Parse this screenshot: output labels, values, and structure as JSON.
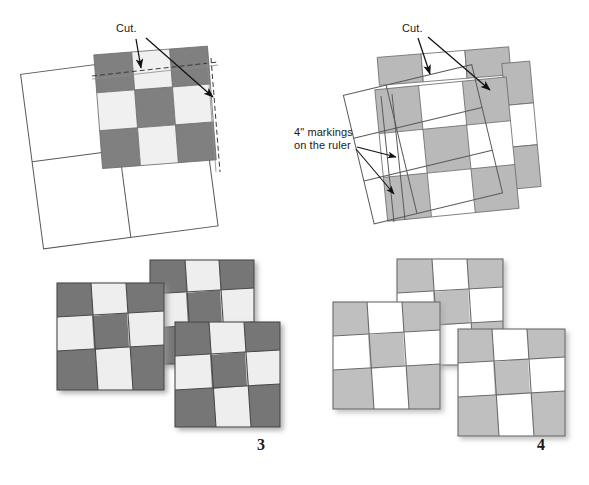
{
  "figure": {
    "panels": [
      {
        "id": "panel-1",
        "position": "top-left",
        "step_label": "",
        "annotations": [
          {
            "name": "cut-label",
            "text": "Cut.",
            "x": 118,
            "y": 24
          }
        ],
        "colors": {
          "dark": "#808080",
          "light": "#f0f0f0",
          "outline": "#555555",
          "background": "#ffffff"
        },
        "description": "Rotated white 2x2 outlined square with a 3x3 dark/light checkerboard block overlaid at upper right; dashed cut lines along top and right edges."
      },
      {
        "id": "panel-2",
        "position": "top-right",
        "step_label": "",
        "annotations": [
          {
            "name": "cut-label",
            "text": "Cut.",
            "x": 404,
            "y": 24
          },
          {
            "name": "ruler-markings-label",
            "text": "4\" markings\non the ruler",
            "x": 295,
            "y": 128
          }
        ],
        "colors": {
          "dark": "#b9b9b9",
          "light": "#ffffff",
          "outline": "#555555",
          "background": "#ffffff"
        },
        "description": "Rotated 3x3 light-gray/white checkerboard with a transparent ruler outline overlaid; top strip and right strip cut away and offset."
      },
      {
        "id": "panel-3",
        "position": "bottom-left",
        "step_label": "3",
        "annotations": [],
        "colors": {
          "dark": "#767676",
          "light": "#eeeeee",
          "outline": "#4a4a4a",
          "shadow": "#cccccc"
        },
        "description": "Three rearranged dark checkerboard squares with slanted seam rows, staggered diagonally."
      },
      {
        "id": "panel-4",
        "position": "bottom-right",
        "step_label": "4",
        "annotations": [],
        "colors": {
          "dark": "#bfbfbf",
          "light": "#ffffff",
          "outline": "#6b6b6b",
          "shadow": "#d4d4d4"
        },
        "description": "Three rearranged light checkerboard squares with slanted seam rows, staggered diagonally."
      }
    ],
    "step_numbers": [
      {
        "name": "step-number-3",
        "value": "3",
        "x": 259,
        "y": 437
      },
      {
        "name": "step-number-4",
        "value": "4",
        "x": 539,
        "y": 437
      }
    ],
    "labels": {
      "cut_left": "Cut.",
      "cut_right": "Cut.",
      "ruler_line1": "4\" markings",
      "ruler_line2": "on the ruler"
    }
  }
}
